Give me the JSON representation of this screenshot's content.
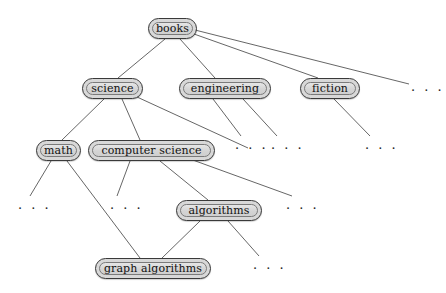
{
  "diagram": {
    "background_color": "#ffffff",
    "node_fill_color": "#d8d8d8",
    "node_border_color": "#3a3a3a",
    "edge_color": "#555555",
    "text_color": "#111111",
    "ellipsis_glyph": "· · ·",
    "nodes": [
      {
        "id": "books",
        "label": "books",
        "x": 148,
        "y": 18,
        "w": 49,
        "h": 21
      },
      {
        "id": "science",
        "label": "science",
        "x": 82,
        "y": 78,
        "w": 61,
        "h": 21
      },
      {
        "id": "engineering",
        "label": "engineering",
        "x": 179,
        "y": 78,
        "w": 92,
        "h": 21
      },
      {
        "id": "fiction",
        "label": "fiction",
        "x": 300,
        "y": 78,
        "w": 60,
        "h": 21
      },
      {
        "id": "math",
        "label": "math",
        "x": 36,
        "y": 140,
        "w": 45,
        "h": 21
      },
      {
        "id": "computer-science",
        "label": "computer science",
        "x": 88,
        "y": 140,
        "w": 127,
        "h": 21
      },
      {
        "id": "algorithms",
        "label": "algorithms",
        "x": 176,
        "y": 200,
        "w": 86,
        "h": 21
      },
      {
        "id": "graph-algorithms",
        "label": "graph algorithms",
        "x": 95,
        "y": 258,
        "w": 116,
        "h": 21
      }
    ],
    "ellipses": [
      {
        "id": "books-more",
        "x": 411,
        "y": 84
      },
      {
        "id": "engineering-child-1",
        "x": 235,
        "y": 142
      },
      {
        "id": "engineering-child-2",
        "x": 271,
        "y": 142
      },
      {
        "id": "fiction-child",
        "x": 365,
        "y": 142
      },
      {
        "id": "math-child",
        "x": 18,
        "y": 202
      },
      {
        "id": "computer-science-child",
        "x": 110,
        "y": 202
      },
      {
        "id": "science-child-more",
        "x": 286,
        "y": 202
      },
      {
        "id": "algorithms-child",
        "x": 253,
        "y": 262
      }
    ],
    "edges": [
      {
        "from": "books",
        "to": "science",
        "x1": 165,
        "y1": 39,
        "x2": 118,
        "y2": 78
      },
      {
        "from": "books",
        "to": "engineering",
        "x1": 180,
        "y1": 39,
        "x2": 215,
        "y2": 78
      },
      {
        "from": "books",
        "to": "fiction",
        "x1": 194,
        "y1": 34,
        "x2": 318,
        "y2": 78
      },
      {
        "from": "books",
        "to": "books-more",
        "x1": 195,
        "y1": 30,
        "x2": 409,
        "y2": 84
      },
      {
        "from": "science",
        "to": "math",
        "x1": 104,
        "y1": 99,
        "x2": 62,
        "y2": 140
      },
      {
        "from": "science",
        "to": "computer-science",
        "x1": 122,
        "y1": 99,
        "x2": 140,
        "y2": 140
      },
      {
        "from": "science",
        "to": "science-child-more",
        "x1": 137,
        "y1": 97,
        "x2": 248,
        "y2": 148
      },
      {
        "from": "engineering",
        "to": "engineering-child-1",
        "x1": 213,
        "y1": 99,
        "x2": 241,
        "y2": 136
      },
      {
        "from": "engineering",
        "to": "engineering-child-2",
        "x1": 243,
        "y1": 99,
        "x2": 277,
        "y2": 136
      },
      {
        "from": "fiction",
        "to": "fiction-child",
        "x1": 334,
        "y1": 99,
        "x2": 370,
        "y2": 136
      },
      {
        "from": "math",
        "to": "math-child",
        "x1": 51,
        "y1": 161,
        "x2": 30,
        "y2": 196
      },
      {
        "from": "math",
        "to": "graph-algorithms",
        "x1": 67,
        "y1": 161,
        "x2": 140,
        "y2": 258
      },
      {
        "from": "computer-science",
        "to": "computer-science-child",
        "x1": 130,
        "y1": 161,
        "x2": 117,
        "y2": 196
      },
      {
        "from": "computer-science",
        "to": "algorithms",
        "x1": 160,
        "y1": 161,
        "x2": 208,
        "y2": 200
      },
      {
        "from": "computer-science",
        "to": "science-child-more",
        "x1": 190,
        "y1": 159,
        "x2": 292,
        "y2": 196
      },
      {
        "from": "algorithms",
        "to": "graph-algorithms",
        "x1": 200,
        "y1": 221,
        "x2": 162,
        "y2": 258
      },
      {
        "from": "algorithms",
        "to": "algorithms-child",
        "x1": 228,
        "y1": 221,
        "x2": 259,
        "y2": 256
      }
    ]
  }
}
